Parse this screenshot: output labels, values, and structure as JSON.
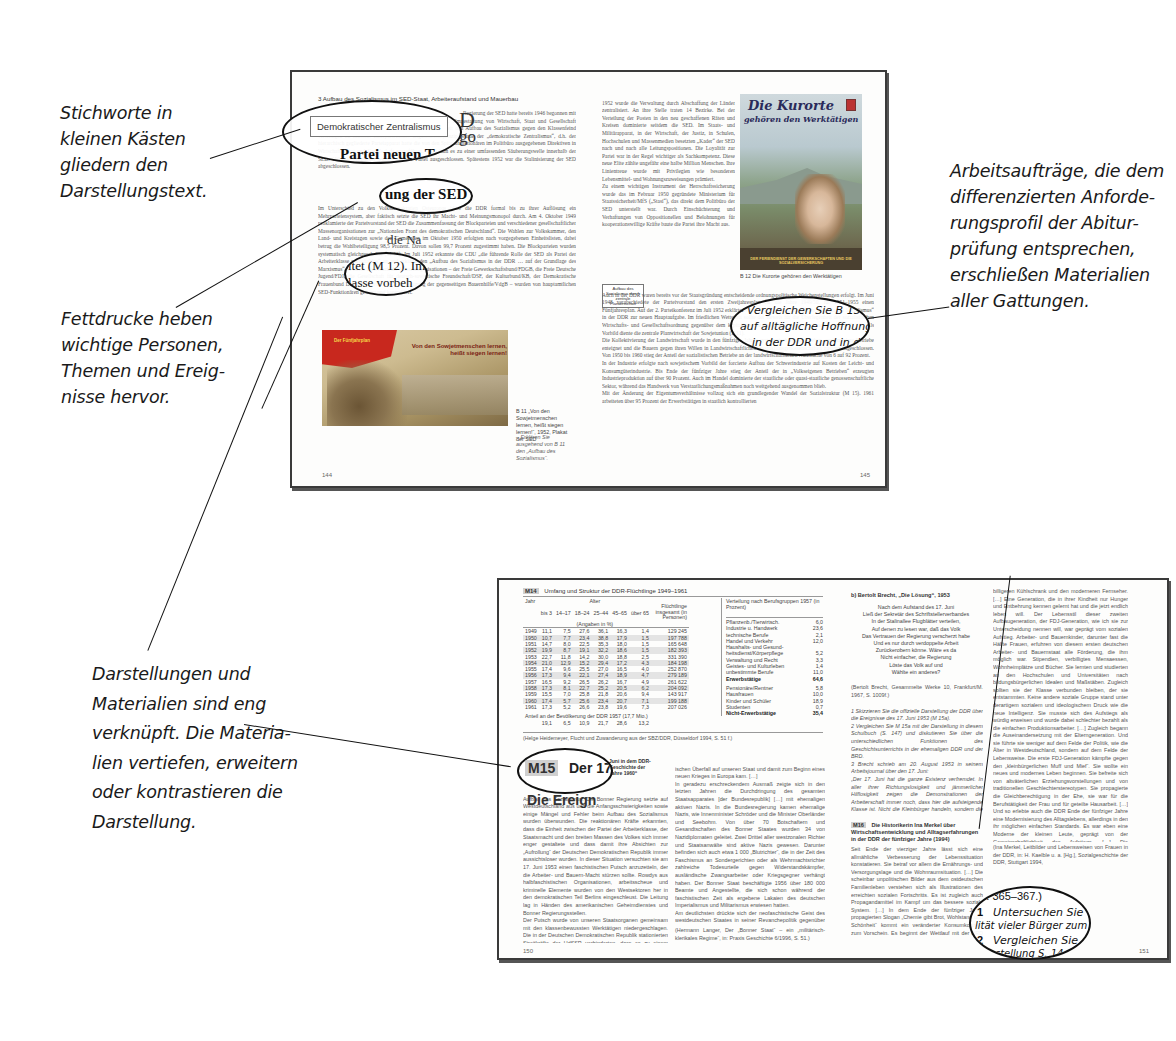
{
  "annotations": {
    "keywords_boxes": "Stichworte in kleinen Kästen gliedern den Darstellungstext.",
    "bold_print": "Fettdrucke heben wichtige Personen, Themen und Ereignisse hervor.",
    "materials_link": "Darstellungen und Materialien sind eng verknüpft. Die Materialien vertiefen, erweitern oder kontrastieren die Darstellung.",
    "work_tasks": "Arbeitsaufträge, die dem differenzierten Anforderungsprofil der Abiturprüfung entsprechen, erschließen Materialien aller Gattungen."
  },
  "annotation_lines": {
    "keywords": [
      "Stichworte in",
      "kleinen Kästen",
      "gliedern den",
      "Darstellungstext."
    ],
    "bold": [
      "Fettdrucke heben",
      "wichtige Personen,",
      "Themen und Ereig-",
      "nisse hervor."
    ],
    "materials": [
      "Darstellungen und",
      "Materialien sind eng",
      "verknüpft. Die Materia-",
      "lien vertiefen, erweitern",
      "oder kontrastieren die",
      "Darstellung."
    ],
    "tasks": [
      "Arbeitsaufträge, die dem",
      "differenzierten Anforde-",
      "rungsprofil der Abitur-",
      "prüfung entsprechen,",
      "erschließen Materialien",
      "aller Gattungen."
    ]
  },
  "spread1": {
    "running_head": "3    Aufbau des Sozialismus im SED-Staat, Arbeiteraufstand und Mauerbau",
    "keyword_box": "Demokratischer Zentralismus",
    "keyword_box_2": "Aufbau des Sozialismus durch zentrale Planwirtschaft",
    "zoom_heading_1": "Partei neuen T",
    "zoom_text_2": "ung der SED ab",
    "zoom_text_3": "ltet (M 12). Im",
    "zoom_text_3b": "lasse vorbeh",
    "zoom_frag_big": "D",
    "zoom_frag_big2": "go",
    "zoom_frag_die": "die Na",
    "left_text_1": "Regierung der SED hatte bereits 1946 begonnen mit der Umwandlung der SED zu einer Partei neuen Typs. Umgestaltung von Wirtschaft, Staat und Gesellschaft organisierte ihren Führungsanspruch mit der Notwendigkeit den Aufbau des Sozialismus gegen den Klassenfeind verteidigen zu müssen. Innerparteiliches Organisationsprinzip wurde der „demokratische Zentralismus“, d.h. der hierarchisch gegliederte Parteiapparat hatte die von den Spitzenfunktionären im Politbüro ausgegebenen Direktiven in Wirtschaft, Staat und Gesellschaft auszuführen. 1950 kam es zu einer umfassenden Säuberungswelle innerhalb der SED. 150 000 Mitglieder wurden aus der Partei ausgeschlossen. Spätestens 1952 war die Stalinisierung der SED abgeschlossen.",
    "left_text_2": "Im Unterschied zu den Volksdemokratien Osteuropas blieb die DDR formal bis zu ihrer Auflösung ein Mehrparteiensystem, aber faktisch setzte die SED ihr Macht- und Meinungsmonopol durch. Am 4. Oktober 1949 proklamierte der Parteivorstand der SED die Zusammenfassung der Blockparteien und verschiedener gesellschaftlicher Massenorganisationen zur „Nationalen Front des demokratischen Deutschland“. Die Wahlen zur Volkskammer, den Land- und Kreistagen sowie den Gemeinden im Oktober 1950 erfolgten nach vorgegebenen Einheitslisten, dabei betrug die Wahlbeteiligung 98,5 Prozent. Davon sollen 99,7 Prozent zugestimmt haben. Die Blockparteien wurden systematisch gleichgeschaltet (M 12). Im Juli 1952 erkannte die CDU „die führende Rolle der SED als Partei der Arbeiterklasse vorbehaltlos“ an und erklärte den „Aufbau des Sozialismus in der DDR … auf der Grundlage des Marxismus“ zu ihrem Ziel. Auch die Massenorganisationen – der Freie Gewerkschaftsbund/FDGB, die Freie Deutsche Jugend/FDJ, die Gesellschaft für deutsch-sowjetische Freundschaft/DSF, der Kulturbund/KB, der Demokratische Frauenbund Deutschlands/DFD, die Vereinigung der gegenseitigen Bauernhilfe/VdgB – wurden von hauptamtlichen SED-Funktionären geleitet und kontrolliert.",
    "poster_b11_text": "Von den Sowjetmenschen lernen, heißt siegen lernen!",
    "poster_b11_flag": "Der Fünfjahrplan",
    "caption_b11": "B 11  „Von den Sowjetmenschen lernen, heißt siegen lernen!“, 1952, Plakat der SED",
    "task_b11": "–  Erklären Sie ausgehend von B 11 den „Aufbau des Sozialismus“.",
    "page_left": "144",
    "right_col_text": "1952 wurde die Verwaltung durch Abschaffung der Länder zentralisiert. An ihre Stelle traten 14 Bezirke. Bei der Verteilung der Posten in den neu geschaffenen Räten und Kreisen dominierte seitdem die SED. Im Staats- und Militärapparat, in der Wirtschaft, der Justiz, in Schulen, Hochschulen und Massenmedien besetzten „Kader“ der SED nach und nach alle Leitungspositionen. Die Loyalität zur Partei war in der Regel wichtiger als Sachkompetenz. Diese neue Elite zählte ungefähr eine halbe Million Menschen. Ihre Linientreue wurde mit Privilegien wie besonderen Lebensmittel- und Wohnungszuweisungen prämiert.\nZu einem wichtigen Instrument der Herrschaftssicherung wurde das im Februar 1950 gegründete Ministerium für Staatssicherheit/MfS („Stasi“), das direkt dem Politbüro der SED unterstellt war. Durch Einschüchterung und Verhaftungen von Oppositionellen und Belohnungen für kooperationswillige Kräfte baute die Partei ihre Macht aus.",
    "right_col_text_2": "Auch in der DDR waren bereits vor der Staatsgründung entscheidende ordnungspolitische Weichenstellungen erfolgt. Im Juni 1948 verabschiedete der Parteivorstand den ersten Zweijahresplan für die Jahre 1949/50, für 1951–1955 einen Fünfjahresplan. Auf der 2. Parteikonferenz im Juli 1952 erklärte Walter Ulbricht den planmäßigen „Aufbau des Sozialismus“ in der DDR zur neuen Hauptaufgabe. Im friedlichen Wettstreit sollte der Beweis für die Überlegenheit der sozialistischen Wirtschafts- und Gesellschaftsordnung gegenüber dem kapitalistischen System im Westen erbracht werden (B 13). Als Vorbild diente die zentrale Planwirtschaft der Sowjetunion (B 11).\nDie Kollektivierung der Landwirtschaft wurde in den fünfziger Jahren systematisch vorangetrieben, auch mittlere Betriebe enteignet und die Bauern gegen ihren Willen in Landwirtschaftlichen Produktionsgenossenschaften zusammengeschlossen. Von 1950 bis 1960 stieg der Anteil der sozialistischen Betriebe an der landwirtschaftlichen Nutzfläche von 6 auf 92 Prozent.\nIn der Industrie erfolgte nach sowjetischem Vorbild der forcierte Aufbau der Schwerindustrie auf Kosten der Leicht- und Konsumgüterindustrie. Bis Ende der fünfziger Jahre stieg der Anteil der in „Volkseigenen Betrieben“ erzeugten Industrieproduktion auf über 90 Prozent. Auch im Handel dominierte der staatliche oder quasi-staatliche genossenschaftliche Sektor, während das Handwerk von Verstaatlichungsmaßnahmen noch weitgehend ausgenommen blieb.\nMit der Änderung der Eigentumsverhältnisse vollzog sich ein grundlegender Wandel der Sozialstruktur (M 15). 1961 arbeiteten über 95 Prozent der Erwerbstätigen in staatlich kontrollierten",
    "poster_b12_title_1": "Die Kurorte",
    "poster_b12_title_2": "gehören den Werktätigen",
    "poster_b12_bottom": "DER FERIENDIENST DER GEWERKSCHAFTEN UND DIE SOZIALVERSICHERUNG",
    "caption_b12": "B 12  Die Kurorte gehören den Werktätigen",
    "zoom_task_1": "–   Vergleichen Sie B 13 mit",
    "zoom_task_2": "auf alltägliche Hoffnungen un",
    "zoom_task_3": "in der DDR und in der Bun",
    "page_right": "145"
  },
  "spread2": {
    "m14_label": "M14",
    "m14_title": "Umfang und Struktur der DDR-Flüchtlinge 1949–1961",
    "m14_headers": {
      "jahr": "Jahr",
      "alter": "Alter",
      "alter_sub": "(Angaben in %)",
      "age_groups": [
        "bis 3",
        "14–17",
        "18–24",
        "25–44",
        "45–65",
        "über 65"
      ],
      "fluechtlinge": "Flüchtlinge insgesamt (in Personen)",
      "verteilung": "Verteilung nach Berufsgruppen 1957 (in Prozent)"
    },
    "m14_rows": [
      [
        "1949",
        "11,1",
        "7,5",
        "27,6",
        "36,1",
        "16,3",
        "1,4",
        "129 245"
      ],
      [
        "1950",
        "10,7",
        "7,7",
        "23,4",
        "38,8",
        "17,9",
        "1,5",
        "197 788"
      ],
      [
        "1951",
        "14,7",
        "8,0",
        "22,5",
        "35,3",
        "18,0",
        "1,5",
        "165 648"
      ],
      [
        "1952",
        "19,9",
        "8,7",
        "19,1",
        "32,2",
        "18,6",
        "1,5",
        "182 393"
      ],
      [
        "1953",
        "22,7",
        "11,8",
        "14,2",
        "30,0",
        "18,8",
        "2,5",
        "331 390"
      ],
      [
        "1954",
        "21,0",
        "12,9",
        "15,2",
        "29,4",
        "17,2",
        "4,3",
        "184 198"
      ],
      [
        "1955",
        "17,4",
        "9,6",
        "25,5",
        "27,0",
        "16,5",
        "4,0",
        "252 870"
      ],
      [
        "1956",
        "17,3",
        "9,4",
        "22,1",
        "27,4",
        "18,9",
        "4,7",
        "279 189"
      ],
      [
        "1957",
        "16,5",
        "9,2",
        "26,5",
        "26,2",
        "16,7",
        "4,9",
        "261 622"
      ],
      [
        "1958",
        "17,3",
        "8,1",
        "22,7",
        "25,2",
        "20,5",
        "6,2",
        "204 092"
      ],
      [
        "1959",
        "15,5",
        "7,0",
        "25,8",
        "21,8",
        "20,6",
        "9,4",
        "143 917"
      ],
      [
        "1960",
        "17,4",
        "5,7",
        "25,6",
        "23,4",
        "20,7",
        "7,1",
        "199 188"
      ],
      [
        "1961",
        "17,3",
        "5,2",
        "26,6",
        "23,8",
        "19,6",
        "7,3",
        "207 026"
      ]
    ],
    "m14_share_label": "Anteil an der Bevölkerung der DDR 1957 (17,7 Mio.)",
    "m14_share_values": [
      "19,1",
      "6,5",
      "10,9",
      "21,7",
      "28,6",
      "13,2"
    ],
    "m14_professions": [
      {
        "label": "Pflanzenb./Tierwirtsch.",
        "value": "6,0"
      },
      {
        "label": "Industrie u. Handwerk",
        "value": "23,6"
      },
      {
        "label": "technische Berufe",
        "value": "2,1"
      },
      {
        "label": "Handel und Verkehr",
        "value": "12,0"
      },
      {
        "label": "Haushalts- und Gesund-",
        "value": ""
      },
      {
        "label": "heitsdienst/Körperpflege",
        "value": "5,2"
      },
      {
        "label": "Verwaltung und Recht",
        "value": "3,3"
      },
      {
        "label": "Geistes- und Kulturleben",
        "value": "1,4"
      },
      {
        "label": "unbestimmte Berufe",
        "value": "11,0"
      },
      {
        "label": "Erwerbstätige",
        "value": "64,6",
        "bold": true
      },
      {
        "label": "Pensionäre/Rentner",
        "value": "5,8"
      },
      {
        "label": "Hausfrauen",
        "value": "10,0"
      },
      {
        "label": "Kinder und Schüler",
        "value": "18,9"
      },
      {
        "label": "Studenten",
        "value": "0,7"
      },
      {
        "label": "Nicht-Erwerbstätige",
        "value": "35,4",
        "bold": true
      }
    ],
    "m14_source": "(Helge Heidemeyer, Flucht und Zuwanderung aus der SBZ/DDR, Düsseldorf 1994, S. 51 f.)",
    "m15_label": "M15",
    "m15_zoom_title": "Der 17.",
    "m15_zoom_sub": "Die Ereign",
    "m15_subtitle": "Juni in dem DDR-Geschichte der Jahre 1960“",
    "m15_text_1": "Aufbau des Sozialismus. Die Bonner Regierung setzte auf Westdeutschland aus und die Anfangsschwierigkeiten sowie einige Mängel und Fehler beim Aufbau des Sozialismus wurden überwunden. Die reaktionären Kräfte erkannten, dass die Einheit zwischen der Partei der Arbeiterklasse, der Staatsmacht und den breiten Massen des Volkes sich immer enger gestaltete und dass damit ihre Absichten zur „Aufrollung“ der Deutschen Demokratischen Republik immer aussichtsloser wurden. In dieser Situation versuchten sie am 17. Juni 1953 einen faschistischen Putsch anzuzetteln, der die Arbeiter- und Bauern-Macht stürzen sollte. Rowdys aus halbfaschistischen Organisationen, arbeitsscheue und kriminelle Elemente wurden von den Westsektoren her in den demokratischen Teil Berlins eingeschleust. Die Leitung lag in Händen des amerikanischen Geheimdienstes und Bonner Regierungsstellen.\nDer Putsch wurde von unseren Staatsorganen gemeinsam mit den klassenbewussten Werktätigen niedergeschlagen. Die in der Deutschen Demokratischen Republik stationierten Streitkräfte der UdSSR verhinderten, dass es zu einem militär-",
    "m15_text_2": "ischen Überfall auf unseren Staat und damit zum Beginn eines neuen Krieges in Europa kam. […]\nIn geradezu erschreckendem Ausmaß zeigte sich in den letzten Jahren die Durchdringung des gesamten Staatsapparates [der Bundesrepublik] […] mit ehemaligen aktiven Nazis. In die Bundesregierung kamen ehemalige Nazis, wie Innenminister Schröder und die Minister Oberländer und Seebohm. Von über 70 Botschaftern und Gesandtschaften des Bonner Staates wurden 34 von Nazidiplomaten geleitet. Zwei Drittel aller westzonalen Richter und Staatsanwälte sind aktive Nazis gewesen. Darunter befinden sich auch etwa 1 000 „Blutrichter“, die in der Zeit des Faschismus an Sondergerichten oder als Wehrmachtsrichter zahlreiche Todesurteile gegen Widerstandskämpfer, ausländische Zwangsarbeiter oder Kriegsgegner verhängt haben. Der Bonner Staat beschäftigte 1956 über 180 000 Beamte und Angestellte, die sich schon während der faschistischen Zeit als ergebene Lakaien des deutschen Imperialismus und Militarismus erwiesen hatten.\nAm deutlichsten drückte sich der neofaschistische Geist des westdeutschen Staates in seiner Revanchepolitik gegenüber den Nachbarstaaten Deutschlands aus.",
    "m15_source": "(Hermann Langer, Der „Bonner Staat“ – ein „militärisch-klerikales Regime“, in: Praxis Geschichte 6/1996, S. 51.)",
    "brecht_heading": "b) Bertolt Brecht, „Die Lösung“, 1953",
    "brecht_poem": [
      "Nach dem Aufstand des 17. Juni",
      "Ließ der Sekretär des Schriftstellerverbandes",
      "In der Stalinallee Flugblätter verteilen,",
      "Auf denen zu lesen war, daß das Volk",
      "Das Vertrauen der Regierung verscherzt habe",
      "Und es nur durch verdoppelte Arbeit",
      "Zurückerobern könne. Wäre es da",
      "Nicht einfacher, die Regierung",
      "Löste das Volk auf und",
      "Wählte ein anderes?"
    ],
    "brecht_source": "(Bertolt Brecht, Gesammelte Werke 10, Frankfurt/M. 1967, S. 1009f.)",
    "brecht_tasks": "1  Skizzieren Sie die offizielle Darstellung der DDR über die Ereignisse des 17. Juni 1953 (M 15a).\n2  Vergleichen Sie M 15a mit der Darstellung in diesem Schulbuch (S. 147) und diskutieren Sie über die unterschiedlichen Funktionen des Geschichtsunterrichts in der ehemaligen DDR und der BRD.\n3  Brecht schrieb am 20. August 1953 in seinem Arbeitsjournal über den 17. Juni:\n„Der 17. Juni hat die ganze Existenz verfremdet. In aller ihrer Richtungslosigkeit und jämmerlicher Hilflosigkeit zeigen die Demonstrationen der Arbeiterschaft immer noch, dass hier die aufsteigende Klasse ist. Nicht die Kleinbürger handeln, sondern die Arbeiter. Ihre Losungen sind verworren und kraftlos, eingeschleust durch den Klassenfeind, und es zeigt sich keinerlei Kraft der Organisation, es entstehen keine Räte, es formt sich kein Plan. Und doch hatten wir hier die Klasse vor uns, in ihrem depraviertesten Zustand, aber die Klasse.“\nVergleichen Sie die Positionen und beziehen Sie Stellung.",
    "m16_label": "M16",
    "m16_title": "Die Historikerin Ina Merkel über Wirtschaftsentwicklung und Alltagserfahrungen in der DDR der fünfziger Jahre (1994)",
    "m16_text": "Seit Ende der vierziger Jahre lässt sich eine allmähliche Verbesserung der Lebenssituation konstatieren. Sie betraf vor allem die Ernährungs- und Versorgungslage und die Wohnraumsituation. […] Die scheinbar unpolitischen Bilder aus dem ostdeutschen Familienleben verstehen sich als Illustrationen des erreichten sozialen Fortschritts. Es ist zugleich auch Propagandamittel im Kampf um das bessere soziale System. […] In dem Ende der fünfziger Jahre propagierten Slogan „Chemie gibt Brot, Wohlstand und Schönheit“ kommt ein veränderter Konsumkonzept zum Vorschein. Es beginnt der Wettlauf mit der BRD um das bessere Auto, den",
    "m16_text_right": "billigeren Kühlschrank und den moderneren Fernseher. […] Eine Generation, die in ihrer Kindheit nur Hunger und Entbehrung kennen gelernt hat und die jetzt endlich leben will. Der Lebensstil dieser zweiten Aufbaugeneration, der FDJ-Generation, wie ich sie zur Unterscheidung nennen will, war geprägt vom sozialen Aufstieg. Arbeiter- und Bauernkinder, darunter fast die Hälfte Frauen, erfuhren von diesem ersten deutschen Arbeiter- und Bauernstaat alle Förderung, die ihm möglich war. Stipendien, verbilligtes Mensaessen, Wohnheimplätze und Bücher. Sie lernten und studierten an den Hochschulen und Universitäten nach bildungsbürgerlichen Idealen und Maßstäben. Zugleich sollten sie der Klasse verbunden bleiben, der sie entstammten. Keine andere soziale Gruppe stand unter derartigem sozialem und ideologischem Druck wie die neue Intelligenz. Sie musste sich des Aufstiegs als würdig erweisen und wurde dabei schlechter bezahlt als die einfachen Produktionsarbeiter. […] Zugleich begann die Auseinandersetzung mit der Elterngeneration. Und sie führte sie weniger auf dem Felde der Politik, wie die Älter in Westdeutschland, sondern auf dem Felde der Lebensweise. Die erste FDJ-Generation kämpfte gegen den „kleinbürgerlichen Muff und Mief“. Sie wollte ein neues und modernes Leben beginnen. Sie befreite sich von altväterlichen Erziehungsvorstellungen und von traditionellen Geschlechterstereotypen. Sie propagierte die Gleichberechtigung in der Ehe, sie war für die Berufstätigkeit der Frau und für geteilte Hausarbeit. […] Und so erlebte auch die DDR Ende der fünfziger Jahre eine Modernisierung des Alltagslebens, allerdings in den ihr möglichen einfachen Standards. Es war eben eine Moderne der kleinen Leute, geprägt von der Gemeinschaftlichkeit des Aufstiegs. […] Die propagandistische Leitlinie jener Jahre war klar gezeichnet: Die moderne Frau, das ist die berufstätige Frau. Die Arbeitstätigkeit von Frauen wurde zum dominierenden Bildmotiv vor allem in Frauenzeitschriften.",
    "m16_source": "(Ina Merkel, Leitbilder und Lebensweisen von Frauen in der DDR, in: H. Kaelble u. a. [Hg.], Sozialgeschichte der DDR, Stuttgart 1994,",
    "zoom_pages": "S. 365–367.)",
    "zoom_t1_num": "1",
    "zoom_t1": "Untersuchen Sie",
    "zoom_t1b": "lität vieler Bürger zum",
    "zoom_t2_num": "2",
    "zoom_t2": "Vergleichen Sie d",
    "zoom_t2b": "Darstellung S. 14",
    "page_left": "150",
    "page_right": "151"
  },
  "colors": {
    "page_border": "#3a3a3a",
    "ink": "#111111",
    "table_shade": "#e4e4e4",
    "m_label_bg": "#d0d0d0",
    "poster_red": "#c8281e"
  }
}
